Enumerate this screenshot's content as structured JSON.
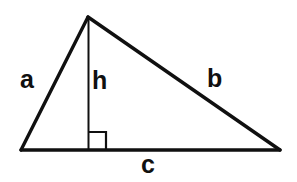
{
  "figure": {
    "background_color": "#ffffff",
    "stroke_color": "#101010",
    "labels": {
      "side_a": "a",
      "side_b": "b",
      "altitude_h": "h",
      "base_c": "c"
    },
    "geometry": {
      "vertex_left": [
        21,
        150
      ],
      "vertex_apex": [
        88,
        17
      ],
      "vertex_right": [
        280,
        150
      ],
      "foot_of_altitude": [
        88,
        150
      ],
      "right_angle_marker": {
        "corner": [
          88,
          150
        ],
        "size": 18,
        "direction": "upper-right"
      }
    },
    "strokes": {
      "base_width": 3.4,
      "side_a_width": 3.4,
      "side_b_width": 3.4,
      "altitude_width": 2.0,
      "right_angle_width": 2.2
    }
  }
}
